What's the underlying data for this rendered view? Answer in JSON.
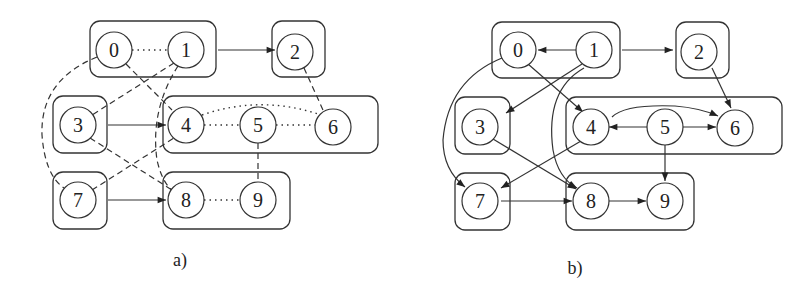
{
  "figure": {
    "panels": [
      {
        "id": "a",
        "caption": "a)",
        "nodes": [
          {
            "id": "0",
            "label": "0"
          },
          {
            "id": "1",
            "label": "1"
          },
          {
            "id": "2",
            "label": "2"
          },
          {
            "id": "3",
            "label": "3"
          },
          {
            "id": "4",
            "label": "4"
          },
          {
            "id": "5",
            "label": "5"
          },
          {
            "id": "6",
            "label": "6"
          },
          {
            "id": "7",
            "label": "7"
          },
          {
            "id": "8",
            "label": "8"
          },
          {
            "id": "9",
            "label": "9"
          }
        ],
        "groups": [
          [
            "0",
            "1"
          ],
          [
            "2"
          ],
          [
            "3"
          ],
          [
            "4",
            "5",
            "6"
          ],
          [
            "7"
          ],
          [
            "8",
            "9"
          ]
        ],
        "edges": {
          "directed_solid": [
            [
              "1",
              "2"
            ],
            [
              "3",
              "4"
            ],
            [
              "7",
              "8"
            ]
          ],
          "dotted": [
            [
              "0",
              "1"
            ],
            [
              "4",
              "5"
            ],
            [
              "5",
              "6"
            ],
            [
              "4",
              "6"
            ],
            [
              "8",
              "9"
            ]
          ],
          "dashed": [
            [
              "0",
              "7"
            ],
            [
              "0",
              "4"
            ],
            [
              "1",
              "3"
            ],
            [
              "1",
              "8"
            ],
            [
              "2",
              "6"
            ],
            [
              "3",
              "8"
            ],
            [
              "7",
              "4"
            ],
            [
              "5",
              "9"
            ]
          ]
        }
      },
      {
        "id": "b",
        "caption": "b)",
        "nodes": [
          {
            "id": "0",
            "label": "0"
          },
          {
            "id": "1",
            "label": "1"
          },
          {
            "id": "2",
            "label": "2"
          },
          {
            "id": "3",
            "label": "3"
          },
          {
            "id": "4",
            "label": "4"
          },
          {
            "id": "5",
            "label": "5"
          },
          {
            "id": "6",
            "label": "6"
          },
          {
            "id": "7",
            "label": "7"
          },
          {
            "id": "8",
            "label": "8"
          },
          {
            "id": "9",
            "label": "9"
          }
        ],
        "groups": [
          [
            "0",
            "1"
          ],
          [
            "2"
          ],
          [
            "3"
          ],
          [
            "4",
            "5",
            "6"
          ],
          [
            "7"
          ],
          [
            "8",
            "9"
          ]
        ],
        "edges": {
          "directed": [
            [
              "1",
              "0"
            ],
            [
              "1",
              "2"
            ],
            [
              "1",
              "3"
            ],
            [
              "1",
              "8"
            ],
            [
              "0",
              "4"
            ],
            [
              "0",
              "7"
            ],
            [
              "2",
              "6"
            ],
            [
              "4",
              "6"
            ],
            [
              "5",
              "4"
            ],
            [
              "5",
              "6"
            ],
            [
              "5",
              "9"
            ],
            [
              "4",
              "7"
            ],
            [
              "3",
              "8"
            ],
            [
              "7",
              "8"
            ],
            [
              "8",
              "9"
            ]
          ]
        }
      }
    ]
  }
}
